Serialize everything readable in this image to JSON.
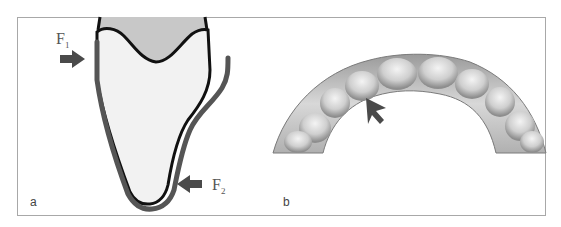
{
  "figure": {
    "panels": [
      {
        "id": "a",
        "label": "a",
        "description": "Cross-section of tooth with aligner, showing forces F1 and F2",
        "forces": [
          {
            "symbol": "F",
            "subscript": "1",
            "direction": "right"
          },
          {
            "symbol": "F",
            "subscript": "2",
            "direction": "left"
          }
        ]
      },
      {
        "id": "b",
        "label": "b",
        "description": "Dental arch with aligner, arrow indicating a location on the lingual side"
      }
    ],
    "colors": {
      "frame": "#a8a8a8",
      "crown_fill": "#c8c8c8",
      "root_fill": "#f2f2f2",
      "tooth_outline": "#111111",
      "aligner": "#555555",
      "arrow": "#4a4a4a"
    }
  }
}
